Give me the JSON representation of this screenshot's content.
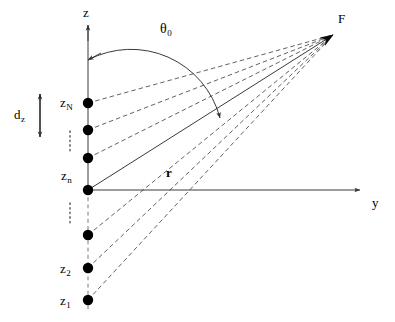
{
  "figure": {
    "background_color": "#ffffff",
    "line_color": "#3a3a3a",
    "dot_color": "#000000",
    "width": 395,
    "height": 322
  },
  "axes": {
    "vertical": {
      "label": "z",
      "label_pos": {
        "x": 83,
        "y": 6
      },
      "x": 88,
      "top_y": 25,
      "bottom_y": 312,
      "origin_y": 190,
      "arrow": "up",
      "solid_from_y": 25,
      "solid_to_y": 190,
      "dashed_from_y": 190,
      "dashed_to_y": 312
    },
    "horizontal": {
      "label": "y",
      "label_pos": {
        "x": 372,
        "y": 196
      },
      "y": 190,
      "left_x": 88,
      "right_x": 360,
      "arrow": "right"
    }
  },
  "focus_point": {
    "label": "F",
    "label_pos": {
      "x": 338,
      "y": 12
    },
    "x": 333,
    "y": 35
  },
  "angle": {
    "label": "θ",
    "subscript": "0",
    "label_pos": {
      "x": 160,
      "y": 22
    },
    "arc_start": {
      "x": 88,
      "y": 60
    },
    "arc_end": {
      "x": 220,
      "y": 118
    },
    "arc_radius": 92,
    "double_headed": true
  },
  "range_vector": {
    "label": "r",
    "bold": true,
    "label_pos": {
      "x": 166,
      "y": 166
    },
    "from": {
      "x": 88,
      "y": 190
    },
    "to": {
      "x": 333,
      "y": 35
    },
    "style": "solid"
  },
  "spacing": {
    "label": "d",
    "subscript": "z",
    "label_pos": {
      "x": 14,
      "y": 108
    },
    "arrow_x": 40,
    "arrow_top_y": 94,
    "arrow_bottom_y": 137,
    "double_headed": true
  },
  "elements": [
    {
      "id": "zN",
      "label": "z",
      "subscript": "N",
      "y": 103,
      "labeled": true,
      "label_pos": {
        "x": 60,
        "y": 96
      }
    },
    {
      "id": "zNm1",
      "label": "",
      "subscript": "",
      "y": 130,
      "labeled": false,
      "label_pos": null
    },
    {
      "id": "zn",
      "label": "z",
      "subscript": "n",
      "y": 158,
      "labeled": true,
      "label_pos": {
        "x": 61,
        "y": 169
      }
    },
    {
      "id": "z0",
      "label": "",
      "subscript": "",
      "y": 190,
      "labeled": false,
      "label_pos": null
    },
    {
      "id": "z3",
      "label": "",
      "subscript": "",
      "y": 235,
      "labeled": false,
      "label_pos": null
    },
    {
      "id": "z2",
      "label": "z",
      "subscript": "2",
      "y": 268,
      "labeled": true,
      "label_pos": {
        "x": 60,
        "y": 262
      }
    },
    {
      "id": "z1",
      "label": "z",
      "subscript": "1",
      "y": 300,
      "labeled": true,
      "label_pos": {
        "x": 60,
        "y": 294
      }
    }
  ],
  "ellipses": [
    {
      "x": 70,
      "y_top": 131,
      "y_bottom": 152
    },
    {
      "x": 70,
      "y_top": 203,
      "y_bottom": 226
    }
  ],
  "dot_radius": 5.2
}
